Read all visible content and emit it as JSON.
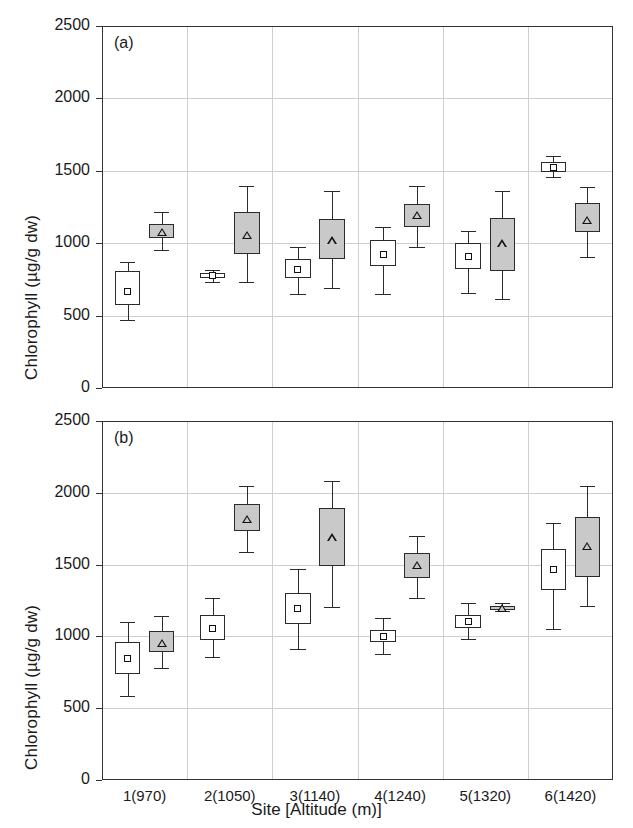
{
  "figure": {
    "ylabel": "Chlorophyll (µg/g dw)",
    "xlabel": "Site [Altitude (m)]",
    "panel_a_tag": "(a)",
    "panel_b_tag": "(b)",
    "categories": [
      "1(970)",
      "2(1050)",
      "3(1140)",
      "4(1240)",
      "5(1320)",
      "6(1420)"
    ],
    "yticks": [
      "0",
      "500",
      "1000",
      "1500",
      "2000",
      "2500"
    ],
    "ylim": [
      0,
      2500
    ],
    "colors": {
      "series_white_fill": "#ffffff",
      "series_gray_fill": "#c9c9c9",
      "line": "#2b2b2b",
      "grid": "#cfcfcf"
    }
  },
  "chart_data": [
    {
      "type": "box",
      "panel": "(a)",
      "title": "",
      "xlabel": "",
      "ylabel": "Chlorophyll (µg/g dw)",
      "ylim": [
        0,
        2500
      ],
      "yticks": [
        0,
        500,
        1000,
        1500,
        2000,
        2500
      ],
      "grid": true,
      "categories": [
        "1(970)",
        "2(1050)",
        "3(1140)",
        "4(1240)",
        "5(1320)",
        "6(1420)"
      ],
      "series": [
        {
          "name": "white-box",
          "marker": "square",
          "fill": "#ffffff",
          "boxes": [
            {
              "whisker_low": 470,
              "q1": 570,
              "mean": 665,
              "q3": 810,
              "whisker_high": 870
            },
            {
              "whisker_low": 735,
              "q1": 760,
              "mean": 775,
              "q3": 795,
              "whisker_high": 815
            },
            {
              "whisker_low": 650,
              "q1": 760,
              "mean": 820,
              "q3": 890,
              "whisker_high": 975
            },
            {
              "whisker_low": 650,
              "q1": 840,
              "mean": 925,
              "q3": 1020,
              "whisker_high": 1110
            },
            {
              "whisker_low": 655,
              "q1": 825,
              "mean": 910,
              "q3": 1000,
              "whisker_high": 1085
            },
            {
              "whisker_low": 1455,
              "q1": 1495,
              "mean": 1525,
              "q3": 1560,
              "whisker_high": 1600
            }
          ]
        },
        {
          "name": "gray-box",
          "marker": "triangle",
          "fill": "#c9c9c9",
          "boxes": [
            {
              "whisker_low": 955,
              "q1": 1035,
              "mean": 1080,
              "q3": 1135,
              "whisker_high": 1215
            },
            {
              "whisker_low": 730,
              "q1": 925,
              "mean": 1060,
              "q3": 1215,
              "whisker_high": 1395
            },
            {
              "whisker_low": 690,
              "q1": 890,
              "mean": 1020,
              "q3": 1165,
              "whisker_high": 1360
            },
            {
              "whisker_low": 975,
              "q1": 1115,
              "mean": 1195,
              "q3": 1270,
              "whisker_high": 1395
            },
            {
              "whisker_low": 615,
              "q1": 805,
              "mean": 1000,
              "q3": 1175,
              "whisker_high": 1360
            },
            {
              "whisker_low": 905,
              "q1": 1080,
              "mean": 1160,
              "q3": 1280,
              "whisker_high": 1390
            }
          ]
        }
      ]
    },
    {
      "type": "box",
      "panel": "(b)",
      "title": "",
      "xlabel": "Site [Altitude (m)]",
      "ylabel": "Chlorophyll (µg/g dw)",
      "ylim": [
        0,
        2500
      ],
      "yticks": [
        0,
        500,
        1000,
        1500,
        2000,
        2500
      ],
      "grid": true,
      "categories": [
        "1(970)",
        "2(1050)",
        "3(1140)",
        "4(1240)",
        "5(1320)",
        "6(1420)"
      ],
      "series": [
        {
          "name": "white-box",
          "marker": "square",
          "fill": "#ffffff",
          "boxes": [
            {
              "whisker_low": 585,
              "q1": 740,
              "mean": 845,
              "q3": 960,
              "whisker_high": 1100
            },
            {
              "whisker_low": 855,
              "q1": 975,
              "mean": 1055,
              "q3": 1150,
              "whisker_high": 1270
            },
            {
              "whisker_low": 915,
              "q1": 1085,
              "mean": 1195,
              "q3": 1300,
              "whisker_high": 1470
            },
            {
              "whisker_low": 875,
              "q1": 960,
              "mean": 1000,
              "q3": 1045,
              "whisker_high": 1125
            },
            {
              "whisker_low": 985,
              "q1": 1060,
              "mean": 1105,
              "q3": 1150,
              "whisker_high": 1230
            },
            {
              "whisker_low": 1050,
              "q1": 1320,
              "mean": 1465,
              "q3": 1610,
              "whisker_high": 1790
            }
          ]
        },
        {
          "name": "gray-box",
          "marker": "triangle",
          "fill": "#c9c9c9",
          "boxes": [
            {
              "whisker_low": 780,
              "q1": 890,
              "mean": 955,
              "q3": 1035,
              "whisker_high": 1140
            },
            {
              "whisker_low": 1590,
              "q1": 1735,
              "mean": 1820,
              "q3": 1920,
              "whisker_high": 2045
            },
            {
              "whisker_low": 1205,
              "q1": 1490,
              "mean": 1690,
              "q3": 1895,
              "whisker_high": 2085
            },
            {
              "whisker_low": 1265,
              "q1": 1410,
              "mean": 1500,
              "q3": 1580,
              "whisker_high": 1700
            },
            {
              "whisker_low": 1175,
              "q1": 1185,
              "mean": 1200,
              "q3": 1215,
              "whisker_high": 1230
            },
            {
              "whisker_low": 1215,
              "q1": 1415,
              "mean": 1630,
              "q3": 1830,
              "whisker_high": 2045
            }
          ]
        }
      ]
    }
  ]
}
